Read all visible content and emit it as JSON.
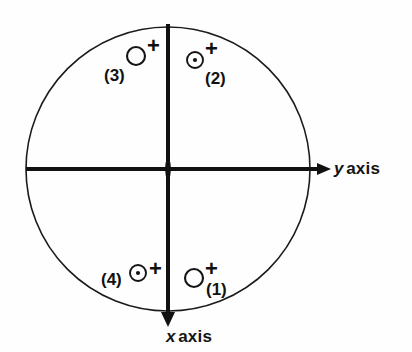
{
  "figure": {
    "type": "quadrant-circle-diagram",
    "background_color": "#fefefe",
    "ink_color": "#111111",
    "circle": {
      "center_x": 168,
      "center_y": 169,
      "radius": 142,
      "stroke_width": 1.6,
      "fill": "none"
    },
    "axes": {
      "stroke_width": 4,
      "color": "#111111",
      "horizontal": {
        "name": "y axis",
        "symbol": "y",
        "word": "axis",
        "from_x": 26,
        "to_x": 331,
        "y": 169,
        "arrow_end": "right"
      },
      "vertical": {
        "name": "x axis",
        "symbol": "x",
        "word": "axis",
        "x": 168,
        "from_y": 24,
        "to_y": 326,
        "arrow_end": "bottom"
      }
    },
    "origin_marker": {
      "shape": "vertical-lens",
      "x": 168,
      "y": 169,
      "half_width": 6,
      "half_height": 13
    }
  },
  "markers": [
    {
      "id": "1",
      "label": "(1)",
      "circle_style": "open",
      "circle_x": 194,
      "circle_y": 278,
      "circle_r": 9,
      "plus": "+",
      "quadrant": "bottom-right",
      "label_position": "right-below"
    },
    {
      "id": "2",
      "label": "(2)",
      "circle_style": "dotted",
      "circle_x": 195,
      "circle_y": 60,
      "circle_r": 8,
      "plus": "+",
      "quadrant": "top-right",
      "label_position": "right-below"
    },
    {
      "id": "3",
      "label": "(3)",
      "circle_style": "open",
      "circle_x": 136,
      "circle_y": 56,
      "circle_r": 9,
      "plus": "+",
      "quadrant": "top-left",
      "label_position": "left-below"
    },
    {
      "id": "4",
      "label": "(4)",
      "circle_style": "dotted",
      "circle_x": 138,
      "circle_y": 273,
      "circle_r": 8,
      "plus": "+",
      "quadrant": "bottom-left",
      "label_position": "left"
    }
  ],
  "labels": {
    "y_axis_symbol": "y",
    "y_axis_word": "axis",
    "x_axis_symbol": "x",
    "x_axis_word": "axis",
    "plus_1": "+",
    "plus_2": "+",
    "plus_3": "+",
    "plus_4": "+",
    "tag_1": "(1)",
    "tag_2": "(2)",
    "tag_3": "(3)",
    "tag_4": "(4)"
  }
}
